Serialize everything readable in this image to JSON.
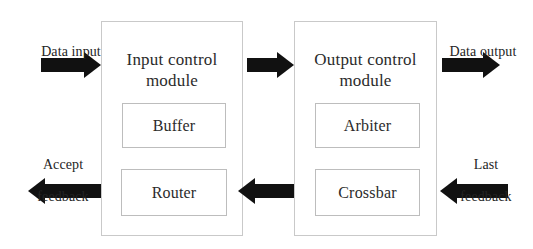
{
  "diagram": {
    "background_color": "#ffffff",
    "arrow_color": "#111111",
    "box_border_color": "#c9c9c9",
    "text_color": "#2b2b2b",
    "modules": [
      {
        "id": "input-control-module",
        "title": "Input control\nmodule",
        "title_line1": "Input control",
        "title_line2": "module",
        "components": [
          {
            "id": "buffer",
            "label": "Buffer"
          },
          {
            "id": "router",
            "label": "Router"
          }
        ]
      },
      {
        "id": "output-control-module",
        "title": "Output control\nmodule",
        "title_line1": "Output control",
        "title_line2": "module",
        "components": [
          {
            "id": "arbiter",
            "label": "Arbiter"
          },
          {
            "id": "crossbar",
            "label": "Crossbar"
          }
        ]
      }
    ],
    "signals": [
      {
        "id": "data-input",
        "label": "Data input",
        "label_line1": "Data input",
        "label_line2": "",
        "direction": "right"
      },
      {
        "id": "input-to-output",
        "label": "",
        "direction": "right"
      },
      {
        "id": "data-output",
        "label": "Data output",
        "label_line1": "Data output",
        "label_line2": "",
        "direction": "right"
      },
      {
        "id": "accept-feedback",
        "label": "Accept\nfeedback",
        "label_line1": "Accept",
        "label_line2": "feedback",
        "direction": "left"
      },
      {
        "id": "output-to-input",
        "label": "",
        "direction": "left"
      },
      {
        "id": "last-feedback",
        "label": "Last\nfeedback",
        "label_line1": "Last",
        "label_line2": "feedback",
        "direction": "left"
      }
    ]
  }
}
